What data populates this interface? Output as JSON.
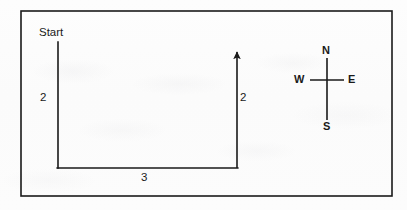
{
  "figure": {
    "type": "path-route-diagram",
    "background_color": "#fcfcfc",
    "ink_color": "#1a1a1a",
    "border": {
      "name": "figure-border",
      "x": 21,
      "y": 11,
      "width": 371,
      "height": 185,
      "stroke_width": 1.6
    }
  },
  "path": {
    "start_label": "Start",
    "stroke_width": 1.6,
    "segments": [
      {
        "id": "left-segment",
        "orientation": "vertical",
        "direction": "south",
        "length_label": "2",
        "x1": 58,
        "y1": 42,
        "x2": 58,
        "y2": 168
      },
      {
        "id": "bottom-segment",
        "orientation": "horizontal",
        "direction": "east",
        "length_label": "3",
        "x1": 58,
        "y1": 168,
        "x2": 237,
        "y2": 168
      },
      {
        "id": "right-segment",
        "orientation": "vertical",
        "direction": "north",
        "length_label": "2",
        "arrowhead": "end",
        "x1": 237,
        "y1": 168,
        "x2": 237,
        "y2": 47
      }
    ]
  },
  "compass": {
    "center_x": 327,
    "center_y": 80,
    "vertical_top": 58,
    "vertical_bottom": 120,
    "horizontal_left": 310,
    "horizontal_right": 344,
    "stroke_width": 1.6,
    "north": "N",
    "south": "S",
    "west": "W",
    "east": "E"
  }
}
